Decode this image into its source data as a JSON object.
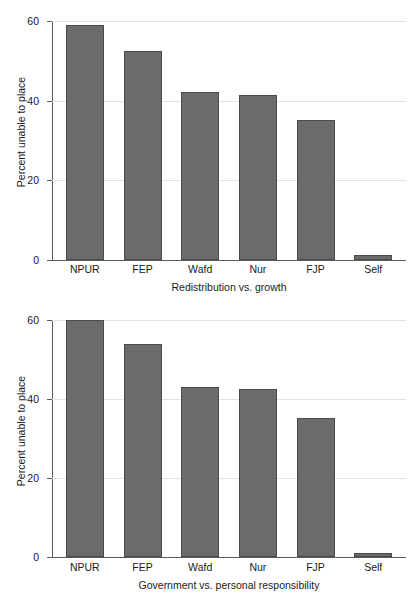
{
  "chart_data": [
    {
      "type": "bar",
      "title": "",
      "xlabel": "Redistribution vs. growth",
      "ylabel": "Percent unable to place",
      "categories": [
        "NPUR",
        "FEP",
        "Wafd",
        "Nur",
        "FJP",
        "Self"
      ],
      "values": [
        59.0,
        52.5,
        42.2,
        41.4,
        35.2,
        1.3
      ],
      "ylim": [
        0,
        60
      ],
      "yticks": [
        0,
        20,
        40,
        60
      ],
      "ytick_labels": [
        "0",
        "20",
        "40",
        "60"
      ],
      "grid": true,
      "legend": "none",
      "bar_color": "#6b6b6b",
      "bar_edge_color": "#4a4a4a"
    },
    {
      "type": "bar",
      "title": "",
      "xlabel": "Government vs. personal responsibility",
      "ylabel": "Percent unable to place",
      "categories": [
        "NPUR",
        "FEP",
        "Wafd",
        "Nur",
        "FJP",
        "Self"
      ],
      "values": [
        60.0,
        54.0,
        43.0,
        42.5,
        35.2,
        1.0
      ],
      "ylim": [
        0,
        60
      ],
      "yticks": [
        0,
        20,
        40,
        60
      ],
      "ytick_labels": [
        "0",
        "20",
        "40",
        "60"
      ],
      "grid": true,
      "legend": "none",
      "bar_color": "#6b6b6b",
      "bar_edge_color": "#4a4a4a"
    }
  ],
  "panels": [
    {
      "ylabel": "Percent unable to place",
      "xtitle": "Redistribution vs. growth",
      "yticks": [
        "60",
        "40",
        "20",
        "0"
      ],
      "bars": [
        {
          "label": "NPUR",
          "value": 59.0
        },
        {
          "label": "FEP",
          "value": 52.5
        },
        {
          "label": "Wafd",
          "value": 42.2
        },
        {
          "label": "Nur",
          "value": 41.4
        },
        {
          "label": "FJP",
          "value": 35.2
        },
        {
          "label": "Self",
          "value": 1.3
        }
      ]
    },
    {
      "ylabel": "Percent unable to place",
      "xtitle": "Government vs. personal responsibility",
      "yticks": [
        "60",
        "40",
        "20",
        "0"
      ],
      "bars": [
        {
          "label": "NPUR",
          "value": 60.0
        },
        {
          "label": "FEP",
          "value": 54.0
        },
        {
          "label": "Wafd",
          "value": 43.0
        },
        {
          "label": "Nur",
          "value": 42.5
        },
        {
          "label": "FJP",
          "value": 35.2
        },
        {
          "label": "Self",
          "value": 1.0
        }
      ]
    }
  ]
}
